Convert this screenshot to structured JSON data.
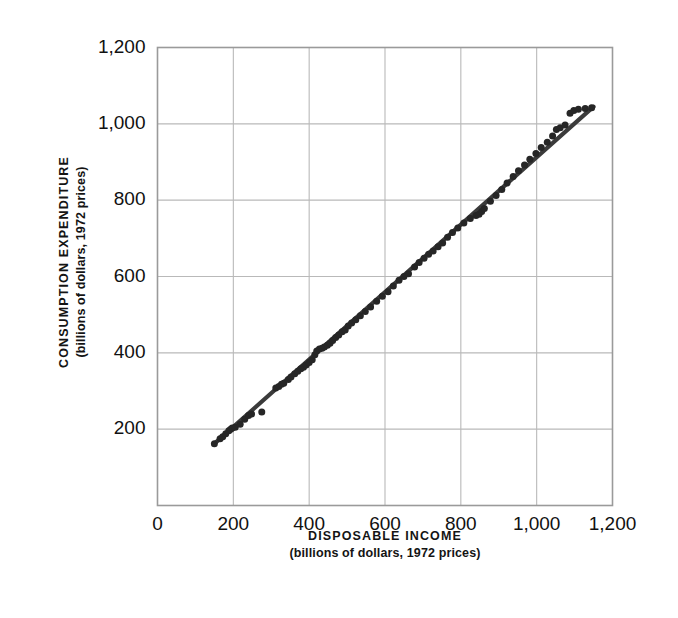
{
  "figure": {
    "background_color": "#ffffff",
    "ink_color": "#141414",
    "grid_color": "#b9b9b9",
    "frame_color": "#9a9a9a",
    "marker_color": "#262626",
    "line_color": "#3b3b3b"
  },
  "axes": {
    "x_title_main": "DISPOSABLE INCOME",
    "x_title_sub": "(billions of dollars, 1972 prices)",
    "y_title_main": "CONSUMPTION EXPENDITURE",
    "y_title_sub": "(billions of dollars, 1972 prices)",
    "x_tick_labels": [
      "0",
      "200",
      "400",
      "600",
      "800",
      "1,000",
      "1,200"
    ],
    "y_tick_labels": [
      "200",
      "400",
      "600",
      "800",
      "1,000",
      "1,200"
    ]
  },
  "chart_data": {
    "type": "scatter",
    "title": "",
    "subtitle": "",
    "xlabel": "DISPOSABLE INCOME (billions of dollars, 1972 prices)",
    "ylabel": "CONSUMPTION EXPENDITURE (billions of dollars, 1972 prices)",
    "xlim": [
      0,
      1200
    ],
    "ylim": [
      0,
      1200
    ],
    "xticks": [
      0,
      200,
      400,
      600,
      800,
      1000,
      1200
    ],
    "yticks": [
      0,
      200,
      400,
      600,
      800,
      1000,
      1200
    ],
    "xtick_labels": [
      "0",
      "200",
      "400",
      "600",
      "800",
      "1,000",
      "1,200"
    ],
    "ytick_labels": [
      "0",
      "200",
      "400",
      "600",
      "800",
      "1,000",
      "1,200"
    ],
    "grid": true,
    "legend": false,
    "marker_style": "filled-circle",
    "marker_size_px": 7,
    "series": [
      {
        "name": "Annual observations",
        "points": [
          [
            150,
            162
          ],
          [
            165,
            175
          ],
          [
            172,
            180
          ],
          [
            180,
            188
          ],
          [
            188,
            196
          ],
          [
            193,
            200
          ],
          [
            197,
            203
          ],
          [
            205,
            205
          ],
          [
            218,
            213
          ],
          [
            230,
            226
          ],
          [
            240,
            236
          ],
          [
            248,
            240
          ],
          [
            275,
            245
          ],
          [
            312,
            308
          ],
          [
            320,
            312
          ],
          [
            327,
            318
          ],
          [
            333,
            320
          ],
          [
            345,
            330
          ],
          [
            352,
            337
          ],
          [
            362,
            345
          ],
          [
            370,
            352
          ],
          [
            378,
            358
          ],
          [
            385,
            362
          ],
          [
            392,
            368
          ],
          [
            400,
            375
          ],
          [
            408,
            382
          ],
          [
            415,
            395
          ],
          [
            420,
            405
          ],
          [
            427,
            410
          ],
          [
            434,
            412
          ],
          [
            440,
            415
          ],
          [
            448,
            420
          ],
          [
            455,
            425
          ],
          [
            462,
            432
          ],
          [
            470,
            440
          ],
          [
            478,
            447
          ],
          [
            487,
            455
          ],
          [
            495,
            460
          ],
          [
            503,
            470
          ],
          [
            512,
            478
          ],
          [
            523,
            487
          ],
          [
            535,
            497
          ],
          [
            548,
            508
          ],
          [
            562,
            520
          ],
          [
            578,
            535
          ],
          [
            593,
            548
          ],
          [
            608,
            560
          ],
          [
            622,
            575
          ],
          [
            637,
            590
          ],
          [
            650,
            600
          ],
          [
            662,
            607
          ],
          [
            678,
            625
          ],
          [
            690,
            637
          ],
          [
            703,
            648
          ],
          [
            715,
            658
          ],
          [
            727,
            667
          ],
          [
            740,
            678
          ],
          [
            752,
            688
          ],
          [
            765,
            703
          ],
          [
            778,
            715
          ],
          [
            792,
            727
          ],
          [
            808,
            740
          ],
          [
            825,
            752
          ],
          [
            840,
            760
          ],
          [
            848,
            763
          ],
          [
            855,
            770
          ],
          [
            862,
            778
          ],
          [
            878,
            797
          ],
          [
            893,
            812
          ],
          [
            908,
            828
          ],
          [
            922,
            845
          ],
          [
            938,
            862
          ],
          [
            952,
            877
          ],
          [
            968,
            892
          ],
          [
            982,
            907
          ],
          [
            998,
            922
          ],
          [
            1012,
            938
          ],
          [
            1028,
            952
          ],
          [
            1042,
            968
          ],
          [
            1052,
            985
          ],
          [
            1062,
            990
          ],
          [
            1075,
            997
          ],
          [
            1088,
            1028
          ],
          [
            1098,
            1035
          ],
          [
            1110,
            1038
          ],
          [
            1128,
            1040
          ],
          [
            1145,
            1042
          ]
        ]
      }
    ],
    "fit_line": {
      "name": "Fitted consumption function",
      "x_start": 148,
      "y_start": 160,
      "x_end": 1150,
      "y_end": 1045,
      "slope": 0.883,
      "intercept": 29.2
    }
  }
}
